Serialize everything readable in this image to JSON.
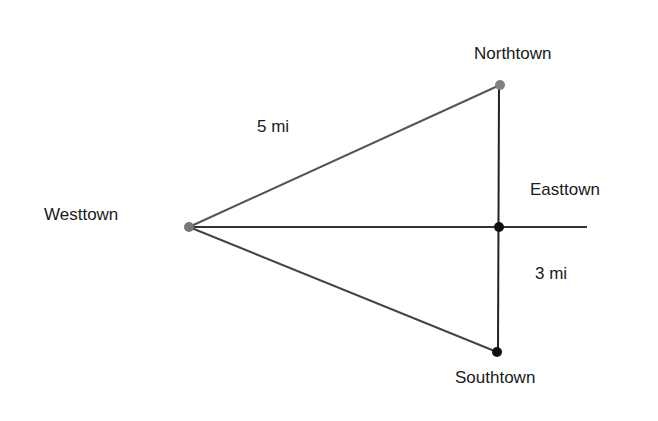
{
  "diagram": {
    "towns": [
      {
        "name": "Westtown",
        "x": 189,
        "y": 227,
        "color": "#777777"
      },
      {
        "name": "Northtown",
        "x": 500,
        "y": 85,
        "color": "#808080"
      },
      {
        "name": "Easttown",
        "x": 499,
        "y": 227,
        "color": "#111111"
      },
      {
        "name": "Southtown",
        "x": 497,
        "y": 352,
        "color": "#111111"
      }
    ],
    "labels": {
      "westtown": "Westtown",
      "northtown": "Northtown",
      "easttown": "Easttown",
      "southtown": "Southtown",
      "dist_west_north": "5 mi",
      "dist_east_south": "3 mi"
    },
    "line_colors": {
      "west_north": "#555555",
      "west_east": "#333333",
      "west_south": "#444444",
      "north_south": "#222222"
    }
  }
}
